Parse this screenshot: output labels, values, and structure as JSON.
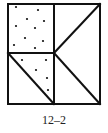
{
  "figure": {
    "caption": "12–2",
    "stroke_color": "#111111",
    "outer_square": {
      "x1": 8,
      "y1": 4,
      "x2": 100,
      "y2": 104
    },
    "vertical_divider_x": 54,
    "horizontal_divider_y": 53,
    "regions": [
      {
        "name": "top-left-square",
        "shaded": "dotted"
      },
      {
        "name": "bottom-left-upper-triangle",
        "shaded": "dotted"
      },
      {
        "name": "bottom-left-lower-triangle",
        "shaded": "none"
      },
      {
        "name": "right-upper-triangle",
        "shaded": "none"
      },
      {
        "name": "right-middle-triangle",
        "shaded": "none"
      },
      {
        "name": "right-lower-triangle",
        "shaded": "none"
      }
    ],
    "dots_top_left": [
      [
        16,
        7
      ],
      [
        38,
        10
      ],
      [
        27,
        19
      ],
      [
        44,
        21
      ],
      [
        16,
        26
      ],
      [
        35,
        28
      ],
      [
        25,
        38
      ],
      [
        43,
        41
      ],
      [
        14,
        45
      ],
      [
        35,
        48
      ]
    ],
    "dots_bottom_left": [
      [
        22,
        60
      ],
      [
        46,
        60
      ],
      [
        36,
        70
      ],
      [
        47,
        78
      ],
      [
        48,
        90
      ]
    ]
  }
}
